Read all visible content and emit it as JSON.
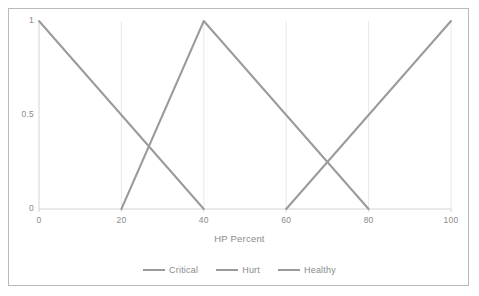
{
  "chart_data": {
    "type": "line",
    "title": "",
    "xlabel": "HP Percent",
    "ylabel": "",
    "xlim": [
      0,
      100
    ],
    "ylim": [
      0,
      1
    ],
    "grid": "vertical",
    "legend_position": "bottom",
    "x_ticks": [
      "0",
      "20",
      "40",
      "60",
      "80",
      "100"
    ],
    "x_tick_values": [
      0,
      20,
      40,
      60,
      80,
      100
    ],
    "y_ticks": [
      "0",
      "0.5",
      "1"
    ],
    "y_tick_values": [
      0,
      0.5,
      1
    ],
    "series": [
      {
        "name": "Critical",
        "color": "#9a9a9a",
        "points": [
          [
            0,
            1
          ],
          [
            40,
            0
          ]
        ]
      },
      {
        "name": "Hurt",
        "color": "#9a9a9a",
        "points": [
          [
            20,
            0
          ],
          [
            40,
            1
          ],
          [
            80,
            0
          ]
        ]
      },
      {
        "name": "Healthy",
        "color": "#9a9a9a",
        "points": [
          [
            60,
            0
          ],
          [
            100,
            1
          ]
        ]
      }
    ],
    "annotations": []
  },
  "legend": {
    "items": [
      {
        "label": "Critical"
      },
      {
        "label": "Hurt"
      },
      {
        "label": "Healthy"
      }
    ]
  },
  "colors": {
    "line": "#9a9a9a",
    "axis": "#d4d4d4",
    "grid": "#e8e8e8",
    "frame": "#b9b9b9",
    "text": "#8a8a8a"
  }
}
